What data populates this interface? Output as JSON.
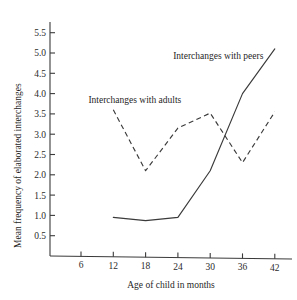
{
  "chart_data": {
    "type": "line",
    "title": "",
    "xlabel": "Age of child in months",
    "ylabel": "Mean frequency of elaborated interchanges",
    "x": [
      6,
      12,
      18,
      24,
      30,
      36,
      42
    ],
    "xticklabels": [
      "6",
      "12",
      "18",
      "24",
      "30",
      "36",
      "42"
    ],
    "xlim": [
      3,
      45
    ],
    "ylim": [
      0,
      5.8
    ],
    "yticks": [
      0.5,
      1.0,
      1.5,
      2.0,
      2.5,
      3.0,
      3.5,
      4.0,
      4.5,
      5.0,
      5.5
    ],
    "yticklabels": [
      "0.5",
      "1.0",
      "1.5",
      "2.0",
      "2.5",
      "3.0",
      "3.5",
      "4.0",
      "4.5",
      "5.0",
      "5.5"
    ],
    "grid": false,
    "legend_position": "inline-annotations",
    "series": [
      {
        "name": "Interchanges with peers",
        "linestyle": "solid",
        "color": "#3a3a3a",
        "x": [
          12,
          18,
          24,
          30,
          36,
          42
        ],
        "values": [
          0.95,
          0.87,
          0.95,
          2.1,
          4.0,
          5.1
        ]
      },
      {
        "name": "Interchanges with adults",
        "linestyle": "dashed",
        "color": "#3a3a3a",
        "x": [
          12,
          18,
          24,
          30,
          36,
          42
        ],
        "values": [
          3.6,
          2.1,
          3.15,
          3.52,
          2.3,
          3.55
        ]
      }
    ],
    "annotations": [
      {
        "text": "Interchanges with peers",
        "x": 31.5,
        "y": 4.85
      },
      {
        "text": "Interchanges with adults",
        "x": 16.0,
        "y": 3.78
      }
    ]
  }
}
